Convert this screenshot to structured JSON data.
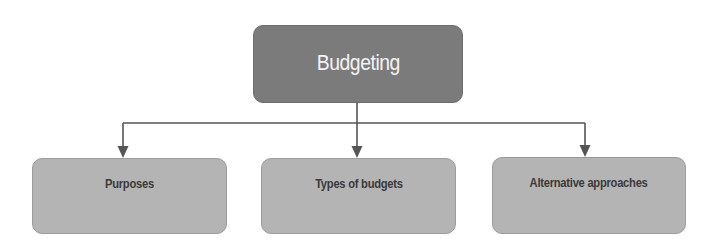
{
  "diagram": {
    "type": "hierarchy",
    "root": {
      "label": "Budgeting",
      "fill": "#7b7b7b",
      "text_color": "#f4f4f4"
    },
    "children": [
      {
        "label": "Purposes",
        "fill": "#b4b4b4",
        "text_color": "#3a3a3a"
      },
      {
        "label": "Types of budgets",
        "fill": "#b4b4b4",
        "text_color": "#3a3a3a"
      },
      {
        "label": "Alternative approaches",
        "fill": "#b4b4b4",
        "text_color": "#3a3a3a"
      }
    ],
    "edges": [
      {
        "from": "Budgeting",
        "to": "Purposes"
      },
      {
        "from": "Budgeting",
        "to": "Types of budgets"
      },
      {
        "from": "Budgeting",
        "to": "Alternative approaches"
      }
    ],
    "connector_color": "#555555"
  }
}
